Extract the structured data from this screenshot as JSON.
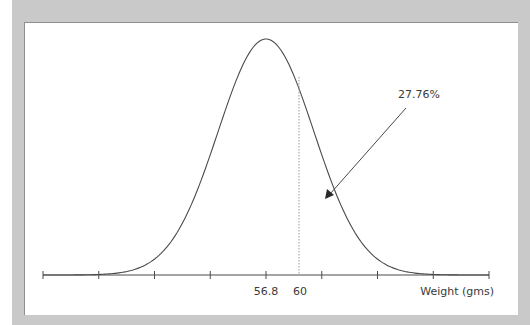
{
  "chart_data": {
    "type": "line",
    "title": "",
    "xlabel": "Weight (gms)",
    "ylabel": "",
    "mean": 56.8,
    "x_marker": 60,
    "labeled_ticks": [
      {
        "index": 4,
        "label": "56.8"
      },
      {
        "value": 60,
        "label": "60"
      }
    ],
    "tick_count": 9,
    "annotation": {
      "text": "27.76%",
      "points_to": "area under curve to the right of 60"
    },
    "grid": false,
    "legend": null
  },
  "labels": {
    "mean": "56.8",
    "marker": "60",
    "xlabel": "Weight (gms)",
    "annotation": "27.76%"
  },
  "colors": {
    "curve": "#4a4a4a",
    "frame": "#c9c9c9",
    "panel": "#ffffff",
    "dotted": "#9a9a9a"
  }
}
